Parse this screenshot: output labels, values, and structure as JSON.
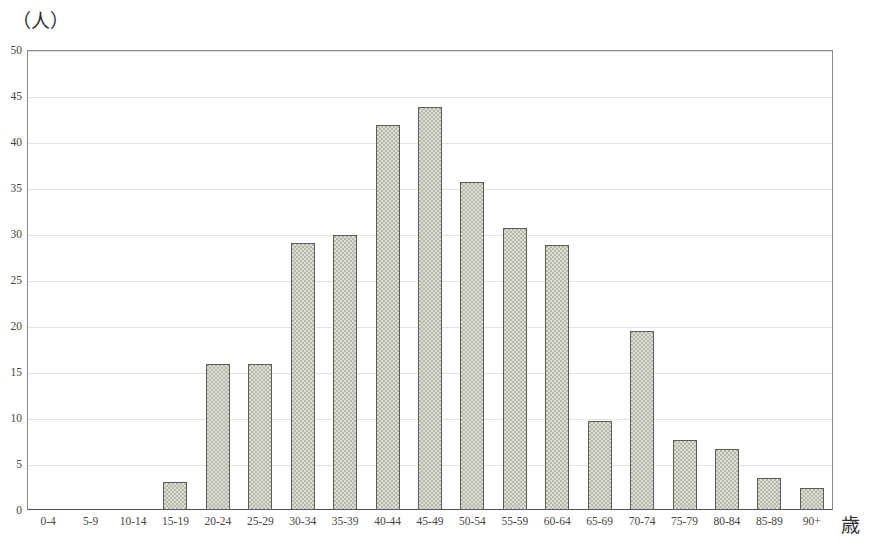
{
  "chart_data": {
    "type": "bar",
    "title": "",
    "xlabel": "歳",
    "ylabel": "（人）",
    "ylim": [
      0,
      50
    ],
    "yticks": [
      0,
      5,
      10,
      15,
      20,
      25,
      30,
      35,
      40,
      45,
      50
    ],
    "grid": true,
    "legend": null,
    "categories": [
      "0-4",
      "5-9",
      "10-14",
      "15-19",
      "20-24",
      "25-29",
      "30-34",
      "35-39",
      "40-44",
      "45-49",
      "50-54",
      "55-59",
      "60-64",
      "65-69",
      "70-74",
      "75-79",
      "80-84",
      "85-89",
      "90+"
    ],
    "values": [
      0,
      0,
      0,
      3.0,
      15.9,
      15.9,
      29.0,
      29.9,
      41.8,
      43.8,
      35.7,
      30.7,
      28.8,
      9.7,
      19.5,
      7.6,
      6.6,
      3.5,
      2.4
    ]
  },
  "style": {
    "bar_fill": "#b6b6a9",
    "bar_stroke": "#5c5c56",
    "grid_color": "#e3e3d8",
    "axis_color": "#8a8a86",
    "baseline_color": "#4d4d4a",
    "text_color": "#45453f",
    "background": "#ffffff"
  }
}
